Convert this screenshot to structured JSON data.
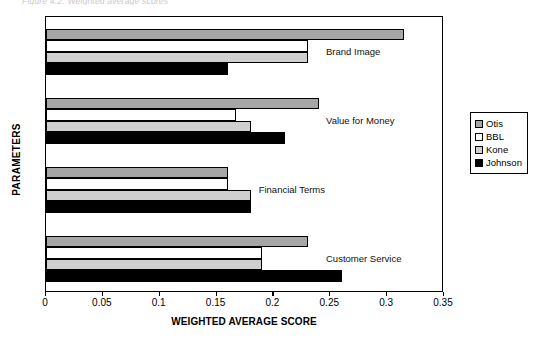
{
  "top_caption": "Figure 4.2: Weighted average scores",
  "legend": {
    "position": "right",
    "entries": [
      {
        "label": "Otis",
        "color": "#a6a6a6"
      },
      {
        "label": "BBL",
        "color": "#ffffff"
      },
      {
        "label": "Kone",
        "color": "#cfcfcf"
      },
      {
        "label": "Johnson",
        "color": "#000000"
      }
    ]
  },
  "axes": {
    "x_title": "WEIGHTED AVERAGE SCORE",
    "y_title": "PARAMETERS",
    "x_ticks": [
      "0",
      "0.05",
      "0.1",
      "0.15",
      "0.2",
      "0.25",
      "0.3",
      "0.35"
    ]
  },
  "chart_data": {
    "type": "bar",
    "orientation": "horizontal",
    "title": "",
    "xlabel": "WEIGHTED AVERAGE SCORE",
    "ylabel": "PARAMETERS",
    "xlim": [
      0,
      0.35
    ],
    "xticks": [
      0,
      0.05,
      0.1,
      0.15,
      0.2,
      0.25,
      0.3,
      0.35
    ],
    "grid": false,
    "legend_position": "right",
    "categories": [
      "Brand Image",
      "Value for Money",
      "Financial Terms",
      "Customer Service"
    ],
    "series": [
      {
        "name": "Otis",
        "color": "#a6a6a6",
        "values": [
          0.315,
          0.24,
          0.16,
          0.23
        ]
      },
      {
        "name": "BBL",
        "color": "#ffffff",
        "values": [
          0.23,
          0.167,
          0.16,
          0.19
        ]
      },
      {
        "name": "Kone",
        "color": "#cfcfcf",
        "values": [
          0.23,
          0.18,
          0.18,
          0.19
        ]
      },
      {
        "name": "Johnson",
        "color": "#000000",
        "values": [
          0.16,
          0.21,
          0.18,
          0.26
        ]
      }
    ]
  }
}
